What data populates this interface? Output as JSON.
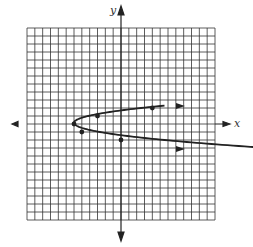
{
  "chart_data": {
    "type": "line",
    "title": "",
    "xlabel": "x",
    "ylabel": "y",
    "grid": true,
    "xlim": [
      -12,
      12
    ],
    "ylim": [
      -12,
      12
    ],
    "series": [
      {
        "name": "sideways parabola",
        "points": [
          {
            "x": -6,
            "y": 0
          },
          {
            "x": -5,
            "y": -1
          },
          {
            "x": -3,
            "y": 1
          },
          {
            "x": 0,
            "y": -2
          },
          {
            "x": 4,
            "y": 2
          }
        ],
        "arrows": "both ends open to the right"
      }
    ]
  },
  "labels": {
    "x_axis": "x",
    "y_axis": "y"
  }
}
